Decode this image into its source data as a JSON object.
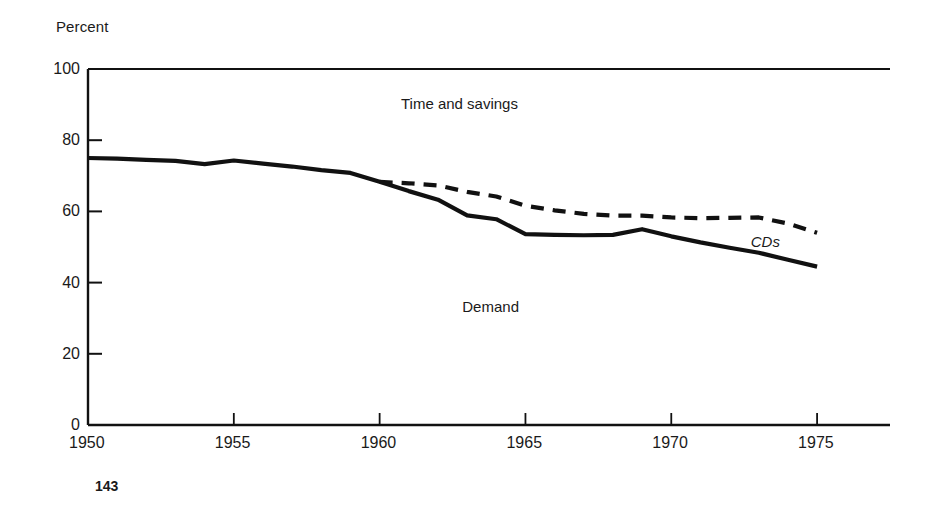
{
  "page": {
    "page_number": "143",
    "background_color": "#ffffff",
    "ink_color": "#111111"
  },
  "labels": {
    "y_axis_title": "Percent",
    "series_upper": "Time and savings",
    "series_lower": "Demand",
    "annotation_cds": "CDs"
  },
  "chart_data": {
    "type": "line",
    "title": "",
    "subtitle": "",
    "xlabel": "",
    "ylabel": "Percent",
    "xlim": [
      1950,
      1977.5
    ],
    "ylim": [
      0,
      100
    ],
    "grid": false,
    "legend": "inline-annotations",
    "x_ticks": [
      1950,
      1955,
      1960,
      1965,
      1970,
      1975
    ],
    "x_tick_labels": [
      "1950",
      "1955",
      "1960",
      "1965",
      "1970",
      "1975"
    ],
    "y_ticks": [
      0,
      20,
      40,
      60,
      80,
      100
    ],
    "y_tick_labels": [
      "0",
      "20",
      "40",
      "60",
      "80",
      "100"
    ],
    "annotations": [
      {
        "text": "Time and savings",
        "x": 1963.2,
        "y": 90,
        "style": "plain"
      },
      {
        "text": "Demand",
        "x": 1964.0,
        "y": 33,
        "style": "plain"
      },
      {
        "text": "CDs",
        "x": 1973.0,
        "y": 51,
        "style": "italic"
      }
    ],
    "series": [
      {
        "name": "Demand",
        "style": "solid",
        "x": [
          1950,
          1951,
          1952,
          1953,
          1954,
          1955,
          1956,
          1957,
          1958,
          1959,
          1960,
          1961,
          1962,
          1963,
          1964,
          1965,
          1966,
          1967,
          1968,
          1969,
          1970,
          1971,
          1972,
          1973,
          1974,
          1975
        ],
        "values": [
          75.0,
          74.8,
          74.5,
          74.2,
          73.3,
          74.3,
          73.4,
          72.6,
          71.6,
          70.8,
          68.3,
          65.7,
          63.3,
          58.9,
          57.8,
          53.6,
          53.4,
          53.3,
          53.4,
          55.0,
          53.0,
          51.3,
          49.8,
          48.4,
          46.4,
          44.5
        ]
      },
      {
        "name": "Time and savings (with CDs)",
        "style": "dashed",
        "x": [
          1960,
          1961,
          1962,
          1963,
          1964,
          1965,
          1966,
          1967,
          1968,
          1969,
          1970,
          1971,
          1972,
          1973,
          1974,
          1975
        ],
        "values": [
          68.3,
          67.9,
          67.3,
          65.5,
          64.2,
          61.6,
          60.3,
          59.3,
          58.8,
          58.8,
          58.3,
          58.1,
          58.2,
          58.3,
          56.6,
          54.0
        ]
      }
    ]
  }
}
